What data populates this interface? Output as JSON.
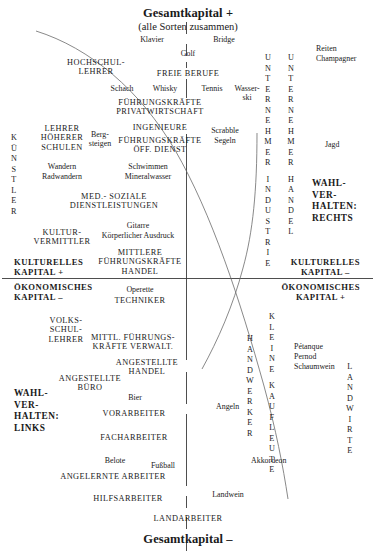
{
  "diagram": {
    "title_top": "Gesamtkapital +",
    "subtitle_top": "(alle Sorten zusammen)",
    "title_bottom": "Gesamtkapital –",
    "quadrant_labels": {
      "kulturelles_plus": "KULTURELLES\nKAPITAL +",
      "kulturelles_minus": "KULTURELLES\nKAPITAL –",
      "oekonomisches_minus": "ÖKONOMISCHES\nKAPITAL –",
      "oekonomisches_plus": "ÖKONOMISCHES\nKAPITAL +",
      "wahl_rechts": "WAHL-\nVER-\nHALTEN:\nRECHTS",
      "wahl_links": "WAHL-\nVER-\nHALTEN:\nLINKS"
    },
    "vertical_labels": [
      {
        "name": "kuenstler",
        "text": "KÜNSTLER"
      },
      {
        "name": "unternehmer-industrie",
        "text": "UNTERNEHMER INDUSTRIE"
      },
      {
        "name": "unternehmer-handel",
        "text": "UNTERNEHMER HANDEL"
      },
      {
        "name": "handwerker",
        "text": "HANDWERKER"
      },
      {
        "name": "kleine-kaufleute",
        "text": "KLEINE KAUFLEUTE"
      },
      {
        "name": "landwirte",
        "text": "LANDWIRTE"
      }
    ],
    "occupations": [
      {
        "name": "hochschullehrer",
        "text": "HOCHSCHUL-\nLEHRER"
      },
      {
        "name": "freie-berufe",
        "text": "FREIE BERUFE"
      },
      {
        "name": "fuehrungskraefte-privatwirtschaft",
        "text": "FÜHRUNGSKRÄFTE\nPRIVATWIRTSCHAFT"
      },
      {
        "name": "ingenieure",
        "text": "INGENIEURE"
      },
      {
        "name": "lehrer-hoeherer-schulen",
        "text": "LEHRER\nHÖHERER\nSCHULEN"
      },
      {
        "name": "fuehrungskraefte-oeff-dienst",
        "text": "FÜHRUNGSKRÄFTE\nÖFF. DIENST"
      },
      {
        "name": "med-soziale-dienstleistungen",
        "text": "MED.- SOZIALE\nDIENSTLEISTUNGEN"
      },
      {
        "name": "kulturvermittler",
        "text": "KULTUR-\nVERMITTLER"
      },
      {
        "name": "mittlere-fuehrungskraefte-handel",
        "text": "MITTLERE\nFÜHRUNGSKRÄFTE\nHANDEL"
      },
      {
        "name": "techniker",
        "text": "TECHNIKER"
      },
      {
        "name": "volksschullehrer",
        "text": "VOLKS-\nSCHUL-\nLEHRER"
      },
      {
        "name": "mittl-fuehrungskraefte-verwalt",
        "text": "MITTL. FÜHRUNGS-\nKRÄFTE VERWALT."
      },
      {
        "name": "angestellte-handel",
        "text": "ANGESTELLTE\nHANDEL"
      },
      {
        "name": "angestellte-buero",
        "text": "ANGESTELLTE\nBÜRO"
      },
      {
        "name": "vorarbeiter",
        "text": "VORARBEITER"
      },
      {
        "name": "facharbeiter",
        "text": "FACHARBEITER"
      },
      {
        "name": "angelernte-arbeiter",
        "text": "ANGELERNTE ARBEITER"
      },
      {
        "name": "hilfsarbeiter",
        "text": "HILFSARBEITER"
      },
      {
        "name": "landarbeiter",
        "text": "LANDARBEITER"
      }
    ],
    "practices": [
      {
        "name": "klavier",
        "text": "Klavier"
      },
      {
        "name": "bridge",
        "text": "Bridge"
      },
      {
        "name": "golf",
        "text": "Golf"
      },
      {
        "name": "reiten",
        "text": "Reiten"
      },
      {
        "name": "champagner",
        "text": "Champagner"
      },
      {
        "name": "schach",
        "text": "Schach"
      },
      {
        "name": "whisky",
        "text": "Whisky"
      },
      {
        "name": "tennis",
        "text": "Tennis"
      },
      {
        "name": "wasserski",
        "text": "Wasser-\nski"
      },
      {
        "name": "scrabble",
        "text": "Scrabble"
      },
      {
        "name": "segeln",
        "text": "Segeln"
      },
      {
        "name": "jagd",
        "text": "Jagd"
      },
      {
        "name": "bergsteigen",
        "text": "Berg-\nsteigen"
      },
      {
        "name": "wandern",
        "text": "Wandern"
      },
      {
        "name": "radwandern",
        "text": "Radwandern"
      },
      {
        "name": "schwimmen",
        "text": "Schwimmen"
      },
      {
        "name": "mineralwasser",
        "text": "Mineralwasser"
      },
      {
        "name": "gitarre",
        "text": "Gitarre"
      },
      {
        "name": "koerperlicher-ausdruck",
        "text": "Körperlicher Ausdruck"
      },
      {
        "name": "operette",
        "text": "Operette"
      },
      {
        "name": "petanque",
        "text": "Pétanque"
      },
      {
        "name": "pernod",
        "text": "Pernod"
      },
      {
        "name": "schaumwein",
        "text": "Schaumwein"
      },
      {
        "name": "bier",
        "text": "Bier"
      },
      {
        "name": "angeln",
        "text": "Angeln"
      },
      {
        "name": "belote",
        "text": "Belote"
      },
      {
        "name": "fussball",
        "text": "Fußball"
      },
      {
        "name": "akkordeon",
        "text": "Akkordeon"
      },
      {
        "name": "landwein",
        "text": "Landwein"
      }
    ]
  }
}
